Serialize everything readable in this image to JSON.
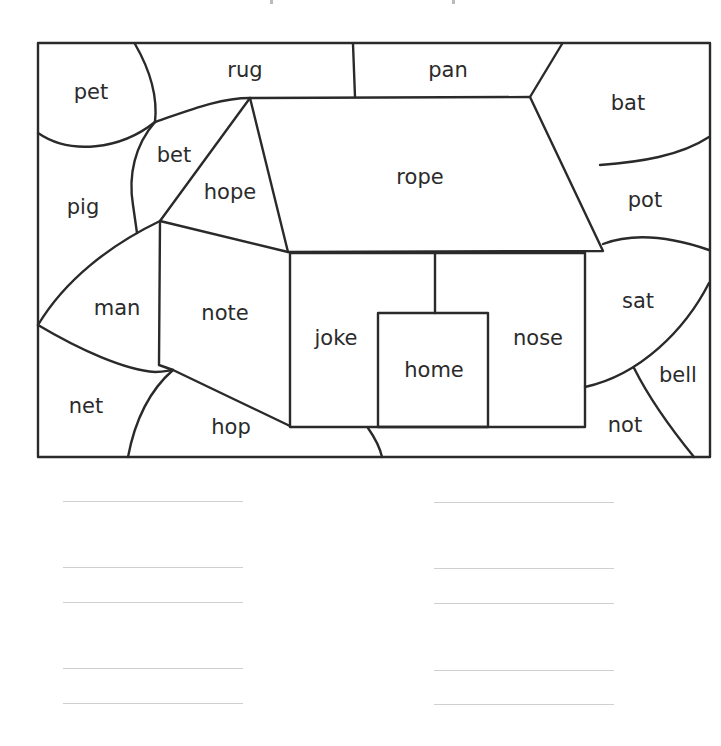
{
  "worksheet": {
    "regions": [
      {
        "id": "pet",
        "word": "pet"
      },
      {
        "id": "rug",
        "word": "rug"
      },
      {
        "id": "pan",
        "word": "pan"
      },
      {
        "id": "bat",
        "word": "bat"
      },
      {
        "id": "bet",
        "word": "bet"
      },
      {
        "id": "hope",
        "word": "hope"
      },
      {
        "id": "rope",
        "word": "rope"
      },
      {
        "id": "pig",
        "word": "pig"
      },
      {
        "id": "pot",
        "word": "pot"
      },
      {
        "id": "man",
        "word": "man"
      },
      {
        "id": "note",
        "word": "note"
      },
      {
        "id": "joke",
        "word": "joke"
      },
      {
        "id": "home",
        "word": "home"
      },
      {
        "id": "nose",
        "word": "nose"
      },
      {
        "id": "sat",
        "word": "sat"
      },
      {
        "id": "bell",
        "word": "bell"
      },
      {
        "id": "net",
        "word": "net"
      },
      {
        "id": "hop",
        "word": "hop"
      },
      {
        "id": "not",
        "word": "not"
      }
    ],
    "answer_columns": [
      {
        "name": "left",
        "line_count": 5
      },
      {
        "name": "right",
        "line_count": 5
      }
    ]
  }
}
